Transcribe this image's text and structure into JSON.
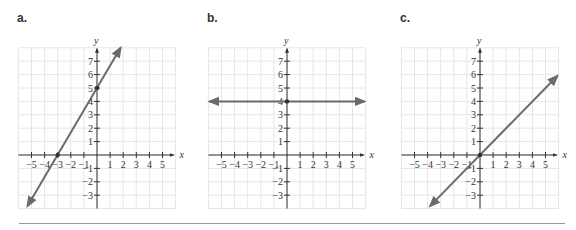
{
  "chart_data": [
    {
      "type": "line",
      "label": "a.",
      "title": "",
      "xlabel": "x",
      "ylabel": "y",
      "x_ticks": [
        -5,
        -4,
        -3,
        -2,
        -1,
        1,
        2,
        3,
        4,
        5
      ],
      "y_ticks": [
        -3,
        -2,
        -1,
        1,
        2,
        3,
        4,
        5,
        6,
        7
      ],
      "xlim": [
        -6,
        6
      ],
      "ylim": [
        -4,
        8
      ],
      "grid": true,
      "series": [
        {
          "name": "line",
          "equation": "y = (5/3)x + 5",
          "slope": 1.6667,
          "intercept": 5,
          "x": [
            -5.3,
            1.8
          ],
          "y": [
            -3.8,
            8.0
          ],
          "arrows": "both"
        }
      ],
      "points": [
        {
          "x": -3,
          "y": 0
        },
        {
          "x": 0,
          "y": 5
        }
      ]
    },
    {
      "type": "line",
      "label": "b.",
      "title": "",
      "xlabel": "x",
      "ylabel": "y",
      "x_ticks": [
        -5,
        -4,
        -3,
        -2,
        -1,
        1,
        2,
        3,
        4,
        5
      ],
      "y_ticks": [
        -3,
        -2,
        -1,
        1,
        2,
        3,
        4,
        5,
        6,
        7
      ],
      "xlim": [
        -6,
        6
      ],
      "ylim": [
        -4,
        8
      ],
      "grid": true,
      "series": [
        {
          "name": "line",
          "equation": "y = 4",
          "slope": 0,
          "intercept": 4,
          "x": [
            -5.9,
            5.9
          ],
          "y": [
            4,
            4
          ],
          "arrows": "both"
        }
      ],
      "points": [
        {
          "x": 0,
          "y": 4
        }
      ]
    },
    {
      "type": "line",
      "label": "c.",
      "title": "",
      "xlabel": "x",
      "ylabel": "y",
      "x_ticks": [
        -5,
        -4,
        -3,
        -2,
        -1,
        1,
        2,
        3,
        4,
        5
      ],
      "y_ticks": [
        -3,
        -2,
        -1,
        1,
        2,
        3,
        4,
        5,
        6,
        7
      ],
      "xlim": [
        -6,
        6
      ],
      "ylim": [
        -4,
        8
      ],
      "grid": true,
      "series": [
        {
          "name": "line",
          "equation": "y = x",
          "slope": 1,
          "intercept": 0,
          "x": [
            -3.8,
            5.9
          ],
          "y": [
            -3.8,
            5.9
          ],
          "arrows": "both"
        }
      ],
      "points": [
        {
          "x": 0,
          "y": 0
        }
      ]
    }
  ],
  "panels": [
    {
      "label": "a."
    },
    {
      "label": "b."
    },
    {
      "label": "c."
    }
  ],
  "colors": {
    "line": "#6b6b6b",
    "axis": "#333333",
    "grid": "#e6e6e6",
    "divider": "#999999"
  }
}
